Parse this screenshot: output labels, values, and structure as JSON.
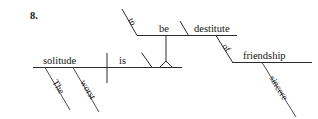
{
  "page": {
    "item_number": "8.",
    "background_color": "#ffffff",
    "ink_color": "#2b2b2b",
    "width": 318,
    "height": 119
  },
  "diagram": {
    "type": "reed-kellogg-sentence-diagram",
    "sentence": "The worst solitude is to be destitute of sincere friendship.",
    "baseline": {
      "subject": "solitude",
      "verb": "is",
      "subject_modifiers": [
        "The",
        "worst"
      ],
      "divider": "subject-verb-vertical-bar",
      "complement_marker": "slanted-line"
    },
    "complement_branch": {
      "stand": "tripod-pedestal",
      "infinitive_marker": "to",
      "infinitive_verb": "be",
      "predicate_adjective": "destitute"
    },
    "prepositional_phrase": {
      "preposition": "of",
      "object": "friendship",
      "object_modifier": "sincere"
    },
    "words": {
      "the": "The",
      "worst": "worst",
      "solitude": "solitude",
      "is": "is",
      "to": "to",
      "be": "be",
      "destitute": "destitute",
      "of": "of",
      "friendship": "friendship",
      "sincere": "sincere"
    }
  }
}
